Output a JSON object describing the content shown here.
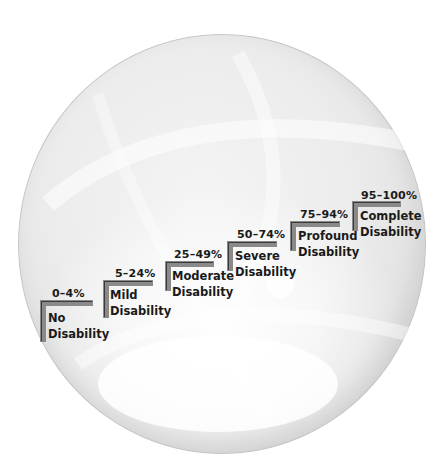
{
  "diagram": {
    "type": "staircase-on-sphere",
    "steps": [
      {
        "range": "0–4%",
        "name_line1": "No",
        "name_line2": "Disability"
      },
      {
        "range": "5–24%",
        "name_line1": "Mild",
        "name_line2": "Disability"
      },
      {
        "range": "25–49%",
        "name_line1": "Moderate",
        "name_line2": "Disability"
      },
      {
        "range": "50–74%",
        "name_line1": "Severe",
        "name_line2": "Disability"
      },
      {
        "range": "75–94%",
        "name_line1": "Profound",
        "name_line2": "Disability"
      },
      {
        "range": "95–100%",
        "name_line1": "Complete",
        "name_line2": "Disability"
      }
    ],
    "colors": {
      "step_fill": "#8a8a8a",
      "step_outline": "#3a3a3a",
      "text": "#1a1a1a",
      "sphere_edge": "#c4c4c4"
    }
  }
}
